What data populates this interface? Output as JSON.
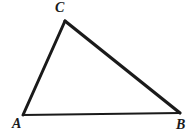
{
  "figure": {
    "kind": "geometry-diagram",
    "shape": "triangle",
    "background_color": "#ffffff",
    "stroke_color": "#1a1a1a",
    "label_color": "#1a1a1a",
    "width": 194,
    "height": 138
  },
  "labels": {
    "a": "A",
    "b": "B",
    "c": "C"
  },
  "vertices": [
    {
      "name": "A",
      "x": 23,
      "y": 115
    },
    {
      "name": "B",
      "x": 180,
      "y": 113
    },
    {
      "name": "C",
      "x": 65,
      "y": 21
    }
  ],
  "edges": [
    {
      "name": "AC",
      "from": "A",
      "to": "C",
      "stroke_width": 3
    },
    {
      "name": "CB",
      "from": "C",
      "to": "B",
      "stroke_width": 3.2
    },
    {
      "name": "AB",
      "from": "A",
      "to": "B",
      "stroke_width": 2.2
    }
  ]
}
